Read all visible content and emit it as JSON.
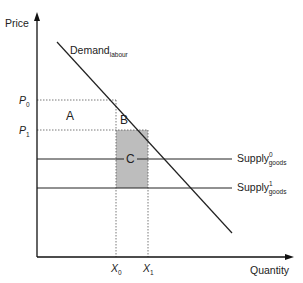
{
  "axes": {
    "y_label": "Price",
    "x_label": "Quantity"
  },
  "curves": {
    "demand": {
      "base": "Demand",
      "sub": "labour"
    },
    "supply0": {
      "base": "Supply",
      "sup": "0",
      "sub": "goods"
    },
    "supply1": {
      "base": "Supply",
      "sup": "1",
      "sub": "goods"
    }
  },
  "price_ticks": [
    {
      "base": "P",
      "sub": "0"
    },
    {
      "base": "P",
      "sub": "1"
    }
  ],
  "quantity_ticks": [
    {
      "base": "X",
      "sub": "0"
    },
    {
      "base": "X",
      "sub": "1"
    }
  ],
  "regions": {
    "a": "A",
    "b": "B",
    "c": "C"
  },
  "colors": {
    "shaded_region": "#bdbdbd",
    "line": "#222222"
  }
}
